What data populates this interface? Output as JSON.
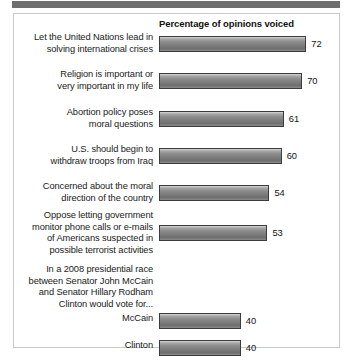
{
  "chart_data": {
    "type": "bar",
    "title": "Percentage of opinions voiced",
    "orientation": "horizontal",
    "xlabel": "",
    "ylabel": "",
    "xlim": [
      0,
      80
    ],
    "grid": false,
    "legend": null,
    "categories": [
      "Let the United Nations lead in solving international crises",
      "Religion is important or very important in my life",
      "Abortion policy poses moral questions",
      "U.S. should begin to withdraw troops from Iraq",
      "Concerned about the moral direction of the country",
      "Oppose letting government monitor phone calls or e-mails of Americans suspected in possible terrorist activities",
      "McCain",
      "Clinton"
    ],
    "values": [
      72,
      70,
      61,
      60,
      54,
      53,
      40,
      40
    ]
  },
  "chart": {
    "header": "Percentage of opinions voiced",
    "rows": [
      {
        "label_lines": [
          "Let the United Nations lead in",
          "solving international crises"
        ],
        "value": 72,
        "value_label": "72",
        "has_bar": true
      },
      {
        "label_lines": [
          "Religion is important or",
          "very important in my life"
        ],
        "value": 70,
        "value_label": "70",
        "has_bar": true
      },
      {
        "label_lines": [
          "Abortion policy poses",
          "moral questions"
        ],
        "value": 61,
        "value_label": "61",
        "has_bar": true
      },
      {
        "label_lines": [
          "U.S. should begin to",
          "withdraw troops from Iraq"
        ],
        "value": 60,
        "value_label": "60",
        "has_bar": true
      },
      {
        "label_lines": [
          "Concerned about the moral",
          "direction of the country"
        ],
        "value": 54,
        "value_label": "54",
        "has_bar": true
      },
      {
        "label_lines": [
          "Oppose letting government",
          "monitor phone calls or e-mails",
          "of Americans suspected in",
          "possible terrorist activities"
        ],
        "value": 53,
        "value_label": "53",
        "has_bar": true
      },
      {
        "label_lines": [
          "In a 2008 presidential race",
          "between Senator John McCain",
          "and Senator Hillary Rodham",
          "Clinton would vote for..."
        ],
        "value": null,
        "value_label": "",
        "has_bar": false
      },
      {
        "label_lines": [
          "McCain"
        ],
        "value": 40,
        "value_label": "40",
        "has_bar": true
      },
      {
        "label_lines": [
          "Clinton"
        ],
        "value": 40,
        "value_label": "40",
        "has_bar": true
      }
    ]
  },
  "colors": {
    "bar_fill_light": "#d7d7d7",
    "bar_fill_dark": "#6f6f6f",
    "bar_border": "#3c3c3c",
    "panel_border": "#c9c9c9",
    "top_rule": "#6e6e6e",
    "text": "#1a1a1a",
    "background": "#ffffff"
  }
}
